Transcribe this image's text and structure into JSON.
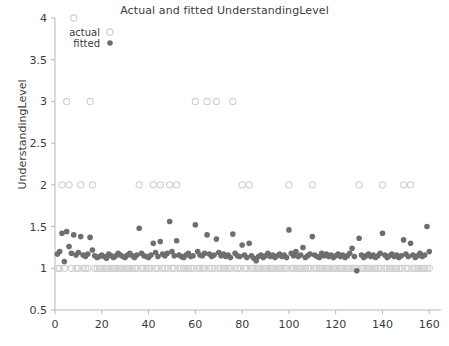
{
  "chart_data": {
    "type": "scatter",
    "title": "Actual and fitted UnderstandingLevel",
    "xlabel": "",
    "ylabel": "UnderstandingLevel",
    "xlim": [
      0,
      165
    ],
    "ylim": [
      0.5,
      4
    ],
    "xticks": [
      0,
      20,
      40,
      60,
      80,
      100,
      120,
      140,
      160
    ],
    "yticks": [
      0.5,
      1,
      1.5,
      2,
      2.5,
      3,
      3.5,
      4
    ],
    "grid": false,
    "legend": {
      "position": "top-left",
      "entries": [
        {
          "name": "actual",
          "marker": "open-circle",
          "color": "#cfcfcf"
        },
        {
          "name": "fitted",
          "marker": "filled-circle",
          "color": "#6e6e6e"
        }
      ]
    },
    "series": [
      {
        "name": "actual",
        "marker": "open-circle",
        "color": "#cfcfcf",
        "x": [
          1,
          2,
          3,
          4,
          5,
          6,
          7,
          8,
          9,
          10,
          11,
          12,
          13,
          14,
          15,
          16,
          17,
          18,
          19,
          20,
          21,
          22,
          23,
          24,
          25,
          26,
          27,
          28,
          29,
          30,
          31,
          32,
          33,
          34,
          35,
          36,
          37,
          38,
          39,
          40,
          41,
          42,
          43,
          44,
          45,
          46,
          47,
          48,
          49,
          50,
          51,
          52,
          53,
          54,
          55,
          56,
          57,
          58,
          59,
          60,
          61,
          62,
          63,
          64,
          65,
          66,
          67,
          68,
          69,
          70,
          71,
          72,
          73,
          74,
          75,
          76,
          77,
          78,
          79,
          80,
          81,
          82,
          83,
          84,
          85,
          86,
          87,
          88,
          89,
          90,
          91,
          92,
          93,
          94,
          95,
          96,
          97,
          98,
          99,
          100,
          101,
          102,
          103,
          104,
          105,
          106,
          107,
          108,
          109,
          110,
          111,
          112,
          113,
          114,
          115,
          116,
          117,
          118,
          119,
          120,
          121,
          122,
          123,
          124,
          125,
          126,
          127,
          128,
          129,
          130,
          131,
          132,
          133,
          134,
          135,
          136,
          137,
          138,
          139,
          140,
          141,
          142,
          143,
          144,
          145,
          146,
          147,
          148,
          149,
          150,
          151,
          152,
          153,
          154,
          155,
          156,
          157,
          158,
          159,
          160
        ],
        "y": [
          1,
          1,
          2,
          1,
          3,
          2,
          1,
          4,
          1,
          1,
          2,
          1,
          1,
          1,
          3,
          2,
          1,
          1,
          1,
          1,
          1,
          1,
          1,
          1,
          1,
          1,
          1,
          1,
          1,
          1,
          1,
          1,
          1,
          1,
          1,
          2,
          1,
          1,
          1,
          1,
          1,
          2,
          1,
          1,
          2,
          1,
          1,
          1,
          2,
          1,
          1,
          2,
          1,
          1,
          1,
          1,
          1,
          1,
          1,
          3,
          1,
          1,
          1,
          1,
          3,
          1,
          1,
          1,
          3,
          1,
          1,
          1,
          1,
          1,
          1,
          3,
          1,
          1,
          1,
          2,
          1,
          1,
          2,
          1,
          1,
          1,
          1,
          1,
          1,
          1,
          1,
          1,
          1,
          1,
          1,
          1,
          1,
          1,
          1,
          2,
          1,
          1,
          1,
          1,
          1,
          1,
          1,
          1,
          1,
          2,
          1,
          1,
          1,
          1,
          1,
          1,
          1,
          1,
          1,
          1,
          1,
          1,
          1,
          1,
          1,
          1,
          1,
          1,
          1,
          2,
          1,
          1,
          1,
          1,
          1,
          1,
          1,
          1,
          1,
          2,
          1,
          1,
          1,
          1,
          1,
          1,
          1,
          1,
          2,
          1,
          1,
          2,
          1,
          1,
          1,
          1,
          1,
          1,
          1,
          1
        ]
      },
      {
        "name": "fitted",
        "marker": "filled-circle",
        "color": "#6e6e6e",
        "x": [
          1,
          2,
          3,
          4,
          5,
          6,
          7,
          8,
          9,
          10,
          11,
          12,
          13,
          14,
          15,
          16,
          17,
          18,
          19,
          20,
          21,
          22,
          23,
          24,
          25,
          26,
          27,
          28,
          29,
          30,
          31,
          32,
          33,
          34,
          35,
          36,
          37,
          38,
          39,
          40,
          41,
          42,
          43,
          44,
          45,
          46,
          47,
          48,
          49,
          50,
          51,
          52,
          53,
          54,
          55,
          56,
          57,
          58,
          59,
          60,
          61,
          62,
          63,
          64,
          65,
          66,
          67,
          68,
          69,
          70,
          71,
          72,
          73,
          74,
          75,
          76,
          77,
          78,
          79,
          80,
          81,
          82,
          83,
          84,
          85,
          86,
          87,
          88,
          89,
          90,
          91,
          92,
          93,
          94,
          95,
          96,
          97,
          98,
          99,
          100,
          101,
          102,
          103,
          104,
          105,
          106,
          107,
          108,
          109,
          110,
          111,
          112,
          113,
          114,
          115,
          116,
          117,
          118,
          119,
          120,
          121,
          122,
          123,
          124,
          125,
          126,
          127,
          128,
          129,
          130,
          131,
          132,
          133,
          134,
          135,
          136,
          137,
          138,
          139,
          140,
          141,
          142,
          143,
          144,
          145,
          146,
          147,
          148,
          149,
          150,
          151,
          152,
          153,
          154,
          155,
          156,
          157,
          158,
          159,
          160
        ],
        "y": [
          1.17,
          1.2,
          1.42,
          1.08,
          1.44,
          1.26,
          1.18,
          1.4,
          1.16,
          1.19,
          1.38,
          1.16,
          1.14,
          1.17,
          1.37,
          1.22,
          1.15,
          1.13,
          1.14,
          1.16,
          1.14,
          1.12,
          1.17,
          1.15,
          1.13,
          1.15,
          1.18,
          1.16,
          1.14,
          1.13,
          1.16,
          1.18,
          1.15,
          1.13,
          1.16,
          1.48,
          1.18,
          1.15,
          1.14,
          1.13,
          1.16,
          1.3,
          1.19,
          1.14,
          1.32,
          1.17,
          1.15,
          1.18,
          1.56,
          1.2,
          1.15,
          1.33,
          1.16,
          1.14,
          1.13,
          1.16,
          1.18,
          1.14,
          1.15,
          1.52,
          1.2,
          1.16,
          1.15,
          1.18,
          1.4,
          1.17,
          1.14,
          1.16,
          1.35,
          1.19,
          1.15,
          1.17,
          1.14,
          1.16,
          1.13,
          1.41,
          1.18,
          1.15,
          1.14,
          1.28,
          1.16,
          1.13,
          1.3,
          1.15,
          1.12,
          1.09,
          1.14,
          1.16,
          1.13,
          1.15,
          1.18,
          1.14,
          1.16,
          1.13,
          1.15,
          1.17,
          1.14,
          1.16,
          1.13,
          1.46,
          1.18,
          1.15,
          1.2,
          1.14,
          1.16,
          1.25,
          1.13,
          1.15,
          1.17,
          1.38,
          1.16,
          1.14,
          1.13,
          1.18,
          1.15,
          1.17,
          1.14,
          1.16,
          1.13,
          1.15,
          1.17,
          1.14,
          1.16,
          1.13,
          1.15,
          1.18,
          1.24,
          1.14,
          0.97,
          1.36,
          1.16,
          1.13,
          1.15,
          1.17,
          1.14,
          1.16,
          1.13,
          1.15,
          1.18,
          1.42,
          1.16,
          1.13,
          1.15,
          1.17,
          1.14,
          1.16,
          1.13,
          1.15,
          1.34,
          1.17,
          1.14,
          1.3,
          1.16,
          1.13,
          1.15,
          1.18,
          1.14,
          1.16,
          1.5,
          1.2
        ]
      }
    ]
  },
  "axes": {
    "x_tick_labels": [
      "0",
      "20",
      "40",
      "60",
      "80",
      "100",
      "120",
      "140",
      "160"
    ],
    "y_tick_labels": [
      "0.5",
      "1",
      "1.5",
      "2",
      "2.5",
      "3",
      "3.5",
      "4"
    ]
  }
}
